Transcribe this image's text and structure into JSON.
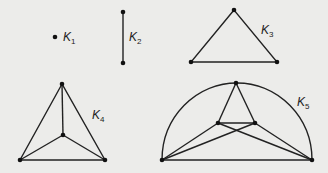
{
  "figure": {
    "graphs": [
      {
        "name": "K1",
        "label_main": "K",
        "label_sub": "1",
        "vertices": 1,
        "edges": 0
      },
      {
        "name": "K2",
        "label_main": "K",
        "label_sub": "2",
        "vertices": 2,
        "edges": 1
      },
      {
        "name": "K3",
        "label_main": "K",
        "label_sub": "3",
        "vertices": 3,
        "edges": 3
      },
      {
        "name": "K4",
        "label_main": "K",
        "label_sub": "4",
        "vertices": 4,
        "edges": 6
      },
      {
        "name": "K5",
        "label_main": "K",
        "label_sub": "5",
        "vertices": 5,
        "edges": 10
      }
    ],
    "colors": {
      "background": "#ececea",
      "ink": "#222222"
    }
  }
}
